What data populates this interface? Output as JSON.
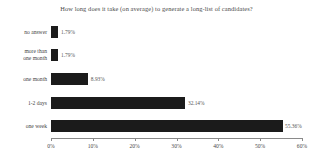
{
  "chart_data": {
    "type": "bar",
    "orientation": "horizontal",
    "title": "How long does it take (on average) to generate a long-list of candidates?",
    "xlabel": "",
    "ylabel": "",
    "xlim": [
      0,
      60
    ],
    "grid": false,
    "legend": null,
    "categories": [
      "no answer",
      "more than\none month",
      "one month",
      "1-2 days",
      "one week"
    ],
    "values": [
      1.79,
      1.79,
      8.93,
      32.14,
      55.36
    ],
    "value_labels": [
      "1.79%",
      "1.79%",
      "8.93%",
      "32.14%",
      "55.36%"
    ],
    "xticks": [
      0,
      10,
      20,
      30,
      40,
      50,
      60
    ],
    "xtick_labels": [
      "0%",
      "10%",
      "20%",
      "30%",
      "40%",
      "50%",
      "60%"
    ],
    "bar_color": "#1b1b1b",
    "axis_color": "#8a8a8a",
    "text_color": "#4a4a4a"
  },
  "categories": [
    {
      "label_line1": "no answer",
      "label_line2": ""
    },
    {
      "label_line1": "more than",
      "label_line2": "one month"
    },
    {
      "label_line1": "one month",
      "label_line2": ""
    },
    {
      "label_line1": "1-2 days",
      "label_line2": ""
    },
    {
      "label_line1": "one week",
      "label_line2": ""
    }
  ]
}
